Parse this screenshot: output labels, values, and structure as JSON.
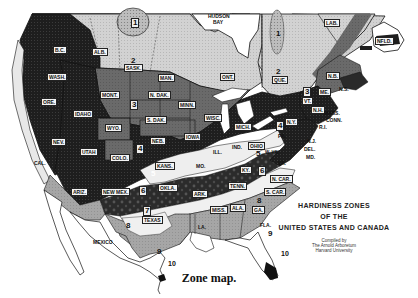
{
  "map": {
    "title_lines": [
      "HARDINESS ZONES",
      "OF THE",
      "UNITED STATES AND CANADA"
    ],
    "credit_lines": [
      "Compiled by",
      "The Arnold Arboretum",
      "Harvard University"
    ],
    "caption": "Zone map.",
    "colors": {
      "zone1": "#8a8a8a",
      "zone2": "#c8c8c8",
      "zone3": "#6e6e6e",
      "zone4": "#2a2a2a",
      "zone5": "#e6e6e6",
      "zone6": "#3a3a3a",
      "zone7": "#f2f2f2",
      "zone8": "#a9a9a9",
      "zone9": "#ffffff",
      "zone10": "#111111",
      "water": "#ffffff",
      "border": "#111111"
    },
    "region_labels": {
      "hudson_bay": "HUDSON",
      "hudson_bay_2": "BAY",
      "mexico": "MEXICO",
      "lab": "LAB.",
      "nfld": "NFLD.",
      "bc": "B.C.",
      "alb": "ALB.",
      "sask": "SASK.",
      "man": "MAN.",
      "ont": "ONT.",
      "que": "QUE.",
      "nb": "N.B.",
      "ns": "N.S.",
      "wash": "WASH.",
      "ore": "ORE.",
      "calif": "CAL.",
      "idaho": "IDAHO",
      "nev": "NEV.",
      "utah": "UTAH",
      "ariz": "ARIZ.",
      "mont": "MONT.",
      "wyo": "WYO.",
      "colo": "COLO.",
      "new_mex": "NEW MEX.",
      "n_dak": "N. DAK.",
      "s_dak": "S. DAK.",
      "neb": "NEB.",
      "kans": "KANS.",
      "okla": "OKLA.",
      "texas": "TEXAS",
      "minn": "MINN.",
      "iowa": "IOWA",
      "mo": "MO.",
      "ark": "ARK.",
      "la": "LA.",
      "wisc": "WISC.",
      "ill": "ILL.",
      "mich": "MICH.",
      "ind": "IND.",
      "ohio": "OHIO",
      "ky": "KY.",
      "tenn": "TENN.",
      "miss": "MISS.",
      "ala": "ALA.",
      "ga": "GA.",
      "fla": "FLA.",
      "s_car": "S. CAR.",
      "n_car": "N. CAR.",
      "va": "VA.",
      "w_va": "W. VA.",
      "pa": "PA.",
      "ny": "N.Y.",
      "vt": "VT.",
      "nh": "N.H.",
      "me": "ME.",
      "mass": "MASS.",
      "conn": "CONN.",
      "ri": "R.I.",
      "nj": "N.J.",
      "del": "DEL.",
      "md": "MD."
    },
    "zone_numbers": {
      "z1_west": "1",
      "z1_east": "1",
      "z2_west": "2",
      "z2_east": "2",
      "z3_mont": "3",
      "z3_east": "3",
      "z4_west": "4",
      "z4_east": "4",
      "z5_mid": "5",
      "z5_kans": "5",
      "z6_ky": "6",
      "z6_sw": "6",
      "z7_tex": "7",
      "z8_tex": "8",
      "z8_ga": "8",
      "z9_tex": "9",
      "z9_fla": "9",
      "z10_tex": "10",
      "z10_fla": "10"
    }
  }
}
